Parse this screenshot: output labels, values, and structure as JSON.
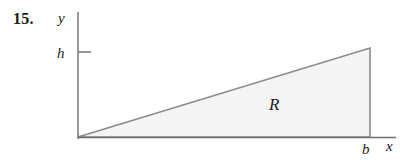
{
  "figure": {
    "problem_number": "15.",
    "region_label": "R",
    "axis_labels": {
      "x": "x",
      "y": "y"
    },
    "tick_labels": {
      "y_height": "h",
      "x_base": "b"
    },
    "colors": {
      "background": "#ffffff",
      "axis_stroke": "#6e6e6e",
      "shape_stroke": "#8a8a8a",
      "shape_fill": "#f4f4f4",
      "text": "#1a1a1a"
    },
    "geometry": {
      "origin": [
        78,
        137
      ],
      "y_axis_top": [
        78,
        12
      ],
      "x_axis_right": [
        396,
        137
      ],
      "triangle_vertices": [
        [
          78,
          137
        ],
        [
          370,
          137
        ],
        [
          370,
          48
        ]
      ],
      "h_tick": [
        [
          78,
          52
        ],
        [
          91,
          52
        ]
      ],
      "base_length_label_at": [
        366,
        148
      ],
      "height_label_at": [
        63,
        57
      ]
    }
  }
}
